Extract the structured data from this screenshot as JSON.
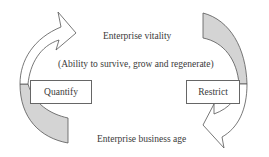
{
  "diagram": {
    "top_label": "Enterprise vitality",
    "subtitle": "(Ability to survive, grow and regenerate)",
    "left_box": "Quantify",
    "right_box": "Restrict",
    "bottom_label": "Enterprise business age"
  },
  "colors": {
    "arrow_tail_fill": "#d4d4d4",
    "arrow_head_fill": "#ffffff",
    "stroke": "#555555"
  }
}
